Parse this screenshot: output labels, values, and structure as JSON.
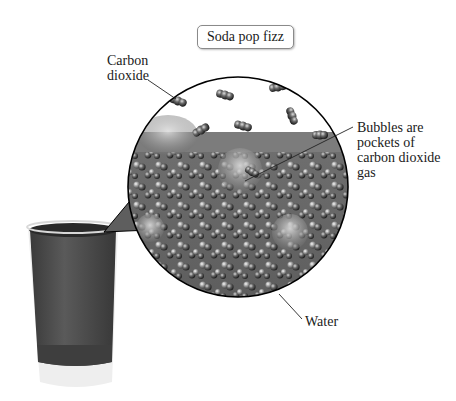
{
  "title": "Soda pop fizz",
  "labels": {
    "carbon_dioxide": "Carbon dioxide",
    "bubbles": "Bubbles are pockets of carbon dioxide gas",
    "water": "Water"
  },
  "illustration": {
    "glass": "glass-of-soda",
    "magnified_view": "magnified-circle-of-soda-molecules",
    "colors": {
      "liquid": "#4a4a4a",
      "glass_base": "#e6e6e6",
      "gas_region": "#ffffff",
      "surface_band": "#777777",
      "outline": "#000000"
    }
  }
}
